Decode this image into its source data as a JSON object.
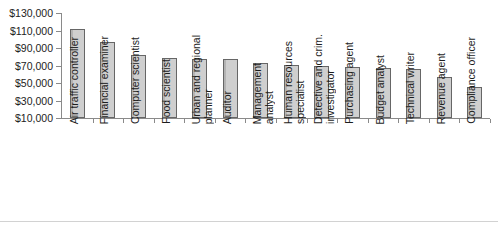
{
  "chart_data": {
    "type": "bar",
    "title": "",
    "xlabel": "",
    "ylabel": "",
    "ylim": [
      10000,
      130000
    ],
    "ytick_step": 20000,
    "grid": false,
    "legend": null,
    "bar_fill_color": "#c6c6c6",
    "bar_border_color": "#666666",
    "axis_color": "#8a8a8a",
    "ytick_labels": [
      "$130,000",
      "$110,000",
      "$90,000",
      "$70,000",
      "$50,000",
      "$30,000",
      "$10,000"
    ],
    "ytick_values": [
      130000,
      110000,
      90000,
      70000,
      50000,
      30000,
      10000
    ],
    "categories": [
      "Air traffic controller",
      "Financial examiner",
      "Computer scientist",
      "Food scientist",
      "Urban and regional planner",
      "Auditor",
      "Management analyst",
      "Human resources specialist",
      "Detective and crim. investigator",
      "Purchasing agent",
      "Budget analyst",
      "Technical writer",
      "Revenue agent",
      "Compliance officer"
    ],
    "category_lines": [
      [
        "Air traffic controller"
      ],
      [
        "Financial examiner"
      ],
      [
        "Computer scientist"
      ],
      [
        "Food scientist"
      ],
      [
        "Urban and regional",
        "planner"
      ],
      [
        "Auditor"
      ],
      [
        "Management",
        "analyst"
      ],
      [
        "Human resources",
        "specialist"
      ],
      [
        "Detective and crim.",
        "investigator"
      ],
      [
        "Purchasing agent"
      ],
      [
        "Budget analyst"
      ],
      [
        "Technical writer"
      ],
      [
        "Revenue agent"
      ],
      [
        "Compliance officer"
      ]
    ],
    "values": [
      112000,
      97000,
      82000,
      79000,
      78000,
      78000,
      73000,
      71000,
      69000,
      68000,
      67000,
      66000,
      57000,
      45000
    ]
  }
}
